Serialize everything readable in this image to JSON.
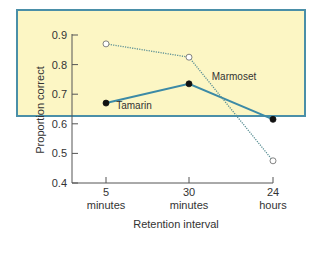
{
  "chart_data": {
    "type": "line",
    "title": "",
    "xlabel": "Retention interval",
    "ylabel": "Proportion correct",
    "categories": [
      "5\nminutes",
      "30\nminutes",
      "24\nhours"
    ],
    "category_labels": [
      {
        "value": "5",
        "unit": "minutes"
      },
      {
        "value": "30",
        "unit": "minutes"
      },
      {
        "value": "24",
        "unit": "hours"
      }
    ],
    "ylim": [
      0.4,
      0.9
    ],
    "yticks": [
      "0.4",
      "0.5",
      "0.6",
      "0.7",
      "0.8",
      "0.9"
    ],
    "grid": false,
    "legend": "inline labels",
    "series": [
      {
        "name": "Tamarin",
        "values": [
          0.67,
          0.735,
          0.615
        ],
        "style": "solid",
        "marker": "filled-circle",
        "color": "#3c8aa6"
      },
      {
        "name": "Marmoset",
        "values": [
          0.87,
          0.825,
          0.475
        ],
        "style": "dotted",
        "marker": "open-circle",
        "color": "#5a8f94"
      }
    ]
  },
  "colors": {
    "panel_bg": "#fcf6c4",
    "panel_border": "#4a8fa8",
    "axis": "#555555"
  }
}
